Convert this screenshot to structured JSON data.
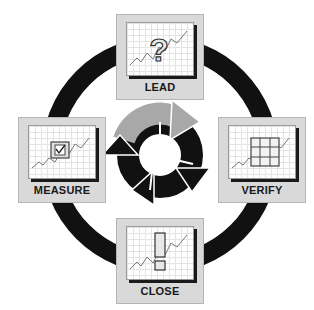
{
  "diagram": {
    "type": "cycle",
    "center_cycle": {
      "arrows": [
        {
          "position": "top",
          "color": "#a8a8a8"
        },
        {
          "position": "right",
          "color": "#111111"
        },
        {
          "position": "bottom",
          "color": "#111111"
        },
        {
          "position": "left",
          "color": "#111111"
        }
      ]
    },
    "ring_color": "#111111",
    "nodes": [
      {
        "id": "lead",
        "label": "LEAD",
        "icon": "question-mark-icon",
        "position": "top"
      },
      {
        "id": "verify",
        "label": "VERIFY",
        "icon": "grid-icon",
        "position": "right"
      },
      {
        "id": "close",
        "label": "CLOSE",
        "icon": "exclamation-mark-icon",
        "position": "bottom"
      },
      {
        "id": "measure",
        "label": "MEASURE",
        "icon": "checkbox-icon",
        "position": "left"
      }
    ]
  }
}
